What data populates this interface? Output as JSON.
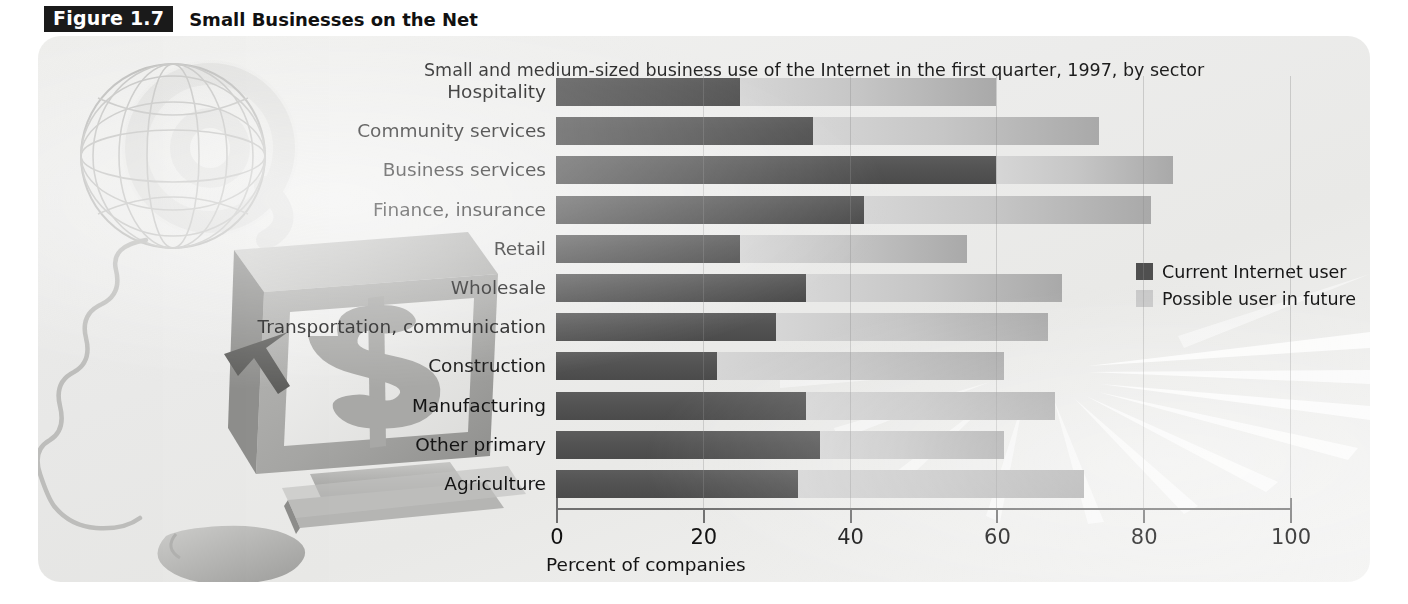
{
  "figure": {
    "badge": "Figure 1.7",
    "title": "Small Businesses on the Net"
  },
  "chart_data": {
    "type": "bar",
    "orientation": "horizontal",
    "stacked": true,
    "title": "Small Businesses on the Net",
    "subtitle": "Small and medium-sized business use of the Internet in the first quarter, 1997, by sector",
    "xlabel": "Percent of companies",
    "ylabel": "",
    "xlim": [
      0,
      100
    ],
    "xticks": [
      0,
      20,
      40,
      60,
      80,
      100
    ],
    "xtick_labels": [
      "0",
      "20",
      "40",
      "60",
      "80",
      "100"
    ],
    "grid": true,
    "grid_axis": "x",
    "legend_position": "right",
    "categories": [
      "Hospitality",
      "Community services",
      "Business services",
      "Finance, insurance",
      "Retail",
      "Wholesale",
      "Transportation, communication",
      "Construction",
      "Manufacturing",
      "Other primary",
      "Agriculture"
    ],
    "series": [
      {
        "name": "Current Internet user",
        "color": "#4f4f4f",
        "values": [
          25,
          35,
          60,
          42,
          25,
          34,
          30,
          22,
          34,
          36,
          33
        ]
      },
      {
        "name": "Possible user in future",
        "color": "#c9c9c9",
        "values": [
          35,
          39,
          24,
          39,
          31,
          35,
          37,
          39,
          34,
          25,
          39
        ]
      }
    ],
    "totals": [
      60,
      74,
      84,
      81,
      56,
      69,
      67,
      61,
      68,
      61,
      72
    ]
  },
  "legend": {
    "items": [
      {
        "label": "Current Internet user",
        "swatch": "current"
      },
      {
        "label": "Possible user in future",
        "swatch": "future"
      }
    ]
  },
  "artwork": {
    "globe": "wireframe-globe",
    "monitor": "computer-monitor-with-dollar-sign",
    "mouse": "computer-mouse",
    "swirl": "at-sign-swirl",
    "rays": "starburst-rays"
  },
  "colors": {
    "current_user": "#4f4f4f",
    "possible_user": "#c9c9c9",
    "axis": "#6f6f6f",
    "panel_background": "#ececeb",
    "badge_background": "#1a1a1a",
    "text": "#141414"
  }
}
